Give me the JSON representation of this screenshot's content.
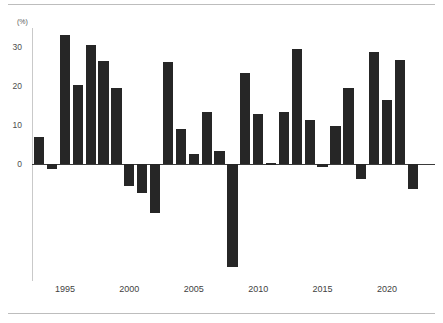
{
  "figure": {
    "unit_label": "(%)",
    "bar_color": "#262626",
    "axis_color": "#c9c9c9",
    "baseline_color": "#3a3a3a",
    "rule_color": "#bdbdbd"
  },
  "chart_data": {
    "type": "bar",
    "title": "",
    "subtitle": "",
    "xlabel": "",
    "ylabel": "(%)",
    "ylim": [
      -30,
      35
    ],
    "yticks": [
      0,
      10,
      20,
      30
    ],
    "ytick_labels": [
      "0",
      "10",
      "20",
      "30"
    ],
    "xticks": [
      1995,
      2000,
      2005,
      2010,
      2015,
      2020
    ],
    "xtick_labels": [
      "1995",
      "2000",
      "2005",
      "2010",
      "2015",
      "2020"
    ],
    "grid": false,
    "legend": null,
    "categories": [
      1993,
      1994,
      1995,
      1996,
      1997,
      1998,
      1999,
      2000,
      2001,
      2002,
      2003,
      2004,
      2005,
      2006,
      2007,
      2008,
      2009,
      2010,
      2011,
      2012,
      2013,
      2014,
      2015,
      2016,
      2017,
      2018,
      2019,
      2020,
      2021,
      2022
    ],
    "values": [
      7.0,
      -1.2,
      33.2,
      20.3,
      30.6,
      26.5,
      19.6,
      -5.5,
      -7.3,
      -12.6,
      26.2,
      9.1,
      2.6,
      13.4,
      3.4,
      -26.5,
      23.4,
      12.8,
      0.2,
      13.5,
      29.5,
      11.4,
      -0.6,
      9.9,
      19.6,
      -3.9,
      28.9,
      16.4,
      26.9,
      -6.4
    ]
  }
}
